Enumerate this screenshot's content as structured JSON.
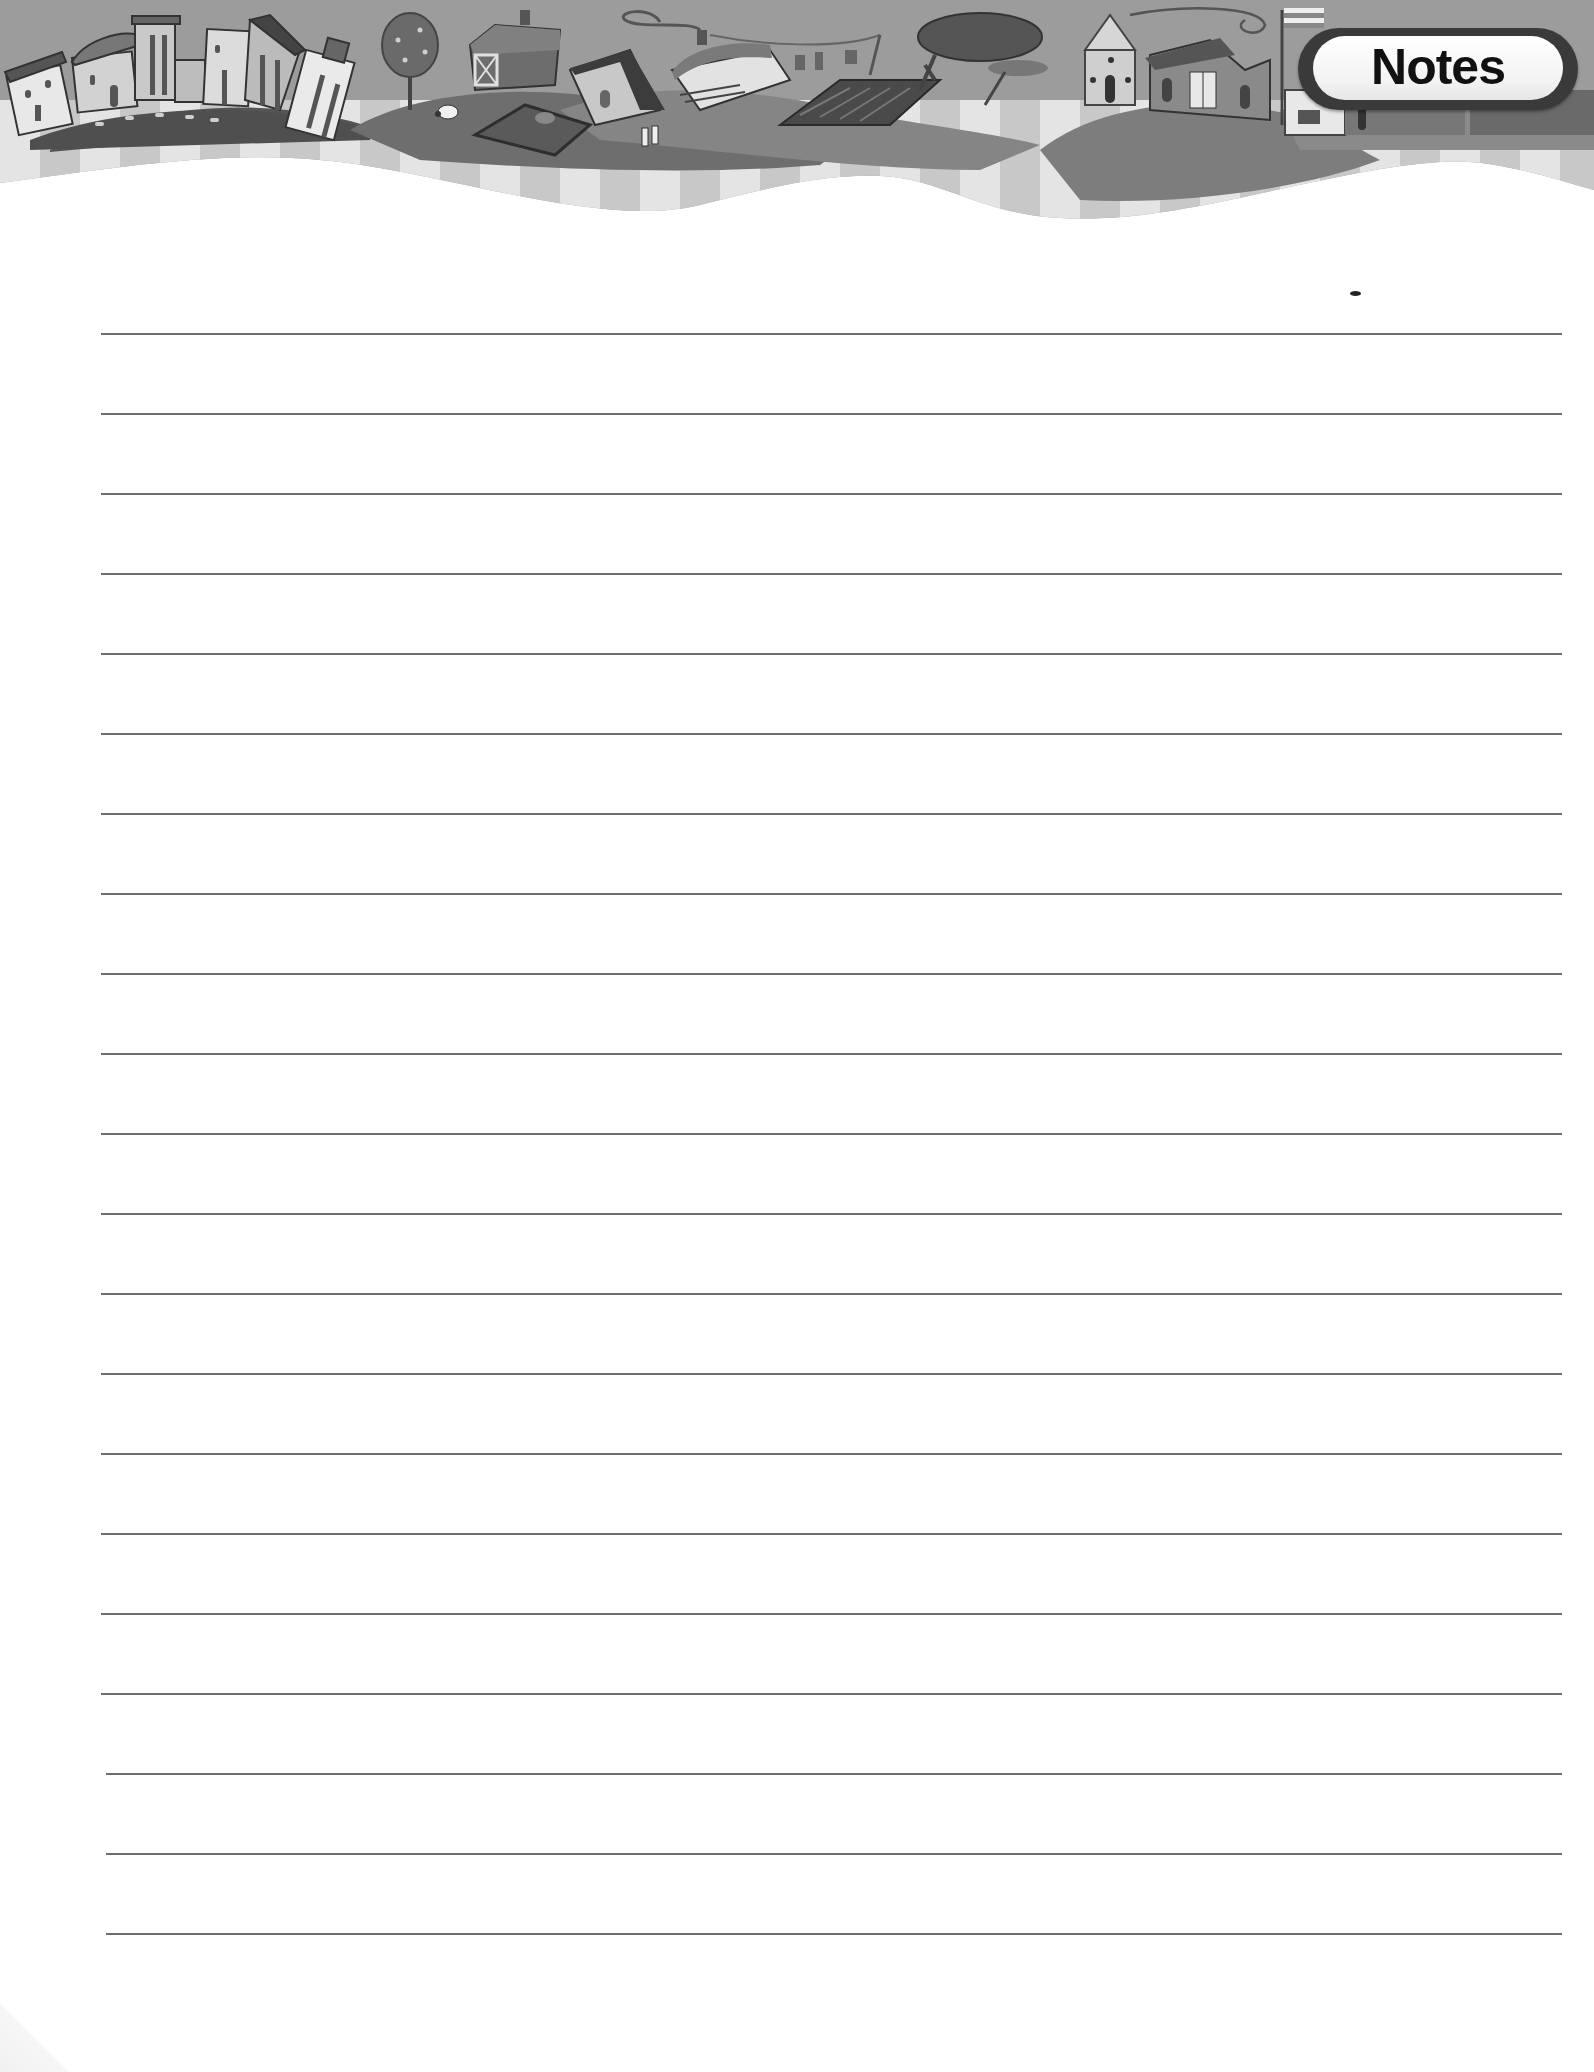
{
  "header": {
    "title": "Notes",
    "illustration": "village-skyline-banner",
    "illustration_elements": [
      "townhouses-on-hill",
      "tree",
      "barn",
      "sheep",
      "fenced-pen",
      "cottage",
      "house-with-chimney",
      "clothesline",
      "plowed-field",
      "round-trees",
      "round-tower-house",
      "house-with-double-doors",
      "flagpole"
    ],
    "colors": {
      "sky": "#9a9a9a",
      "hills": "#7a7a7a",
      "stripe_light": "#e6e6e6",
      "stripe_dark": "#c9c9c9",
      "badge_border": "#3a3a3a",
      "badge_fill": "#ffffff"
    }
  },
  "ruled_area": {
    "line_count": 21,
    "first_line_y": 334,
    "line_spacing": 80,
    "line_left": 101,
    "line_right": 1562,
    "line_color": "#6e6e6e",
    "lines": [
      "",
      "",
      "",
      "",
      "",
      "",
      "",
      "",
      "",
      "",
      "",
      "",
      "",
      "",
      "",
      "",
      "",
      "",
      "",
      "",
      ""
    ]
  }
}
